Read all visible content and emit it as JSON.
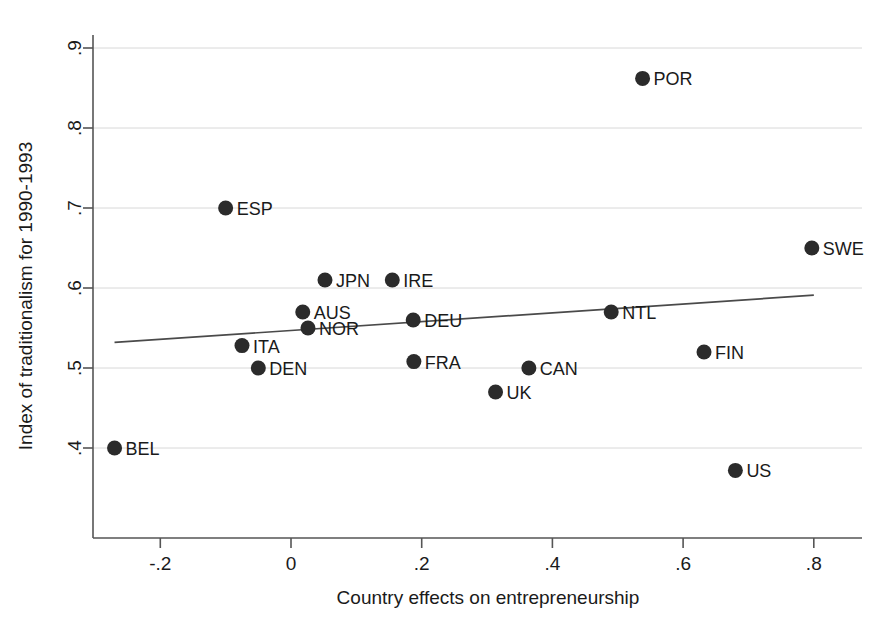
{
  "chart_data": {
    "type": "scatter",
    "title": "",
    "xlabel": "Country effects on entrepreneurship",
    "ylabel": "Index of traditionalism for 1990-1993",
    "xlim": [
      -0.3,
      0.86
    ],
    "ylim": [
      0.355,
      0.93
    ],
    "grid": true,
    "legend": "none",
    "xticks": [
      -0.2,
      0,
      0.2,
      0.4,
      0.6,
      0.8
    ],
    "xtick_labels": [
      "-.2",
      "0",
      ".2",
      ".4",
      ".6",
      ".8"
    ],
    "yticks": [
      0.4,
      0.5,
      0.6,
      0.7,
      0.8,
      0.9
    ],
    "ytick_labels": [
      ".4",
      ".5",
      ".6",
      ".7",
      ".8",
      ".9"
    ],
    "point_color": "#2b2b2b",
    "line_color": "#4a4a4a",
    "grid_color": "#d8d8d8",
    "points": [
      {
        "label": "BEL",
        "x": -0.27,
        "y": 0.4
      },
      {
        "label": "ESP",
        "x": -0.1,
        "y": 0.7
      },
      {
        "label": "ITA",
        "x": -0.075,
        "y": 0.528
      },
      {
        "label": "DEN",
        "x": -0.05,
        "y": 0.5
      },
      {
        "label": "AUS",
        "x": 0.018,
        "y": 0.57
      },
      {
        "label": "NOR",
        "x": 0.026,
        "y": 0.55
      },
      {
        "label": "JPN",
        "x": 0.052,
        "y": 0.61
      },
      {
        "label": "IRE",
        "x": 0.155,
        "y": 0.61
      },
      {
        "label": "DEU",
        "x": 0.187,
        "y": 0.56
      },
      {
        "label": "FRA",
        "x": 0.188,
        "y": 0.508
      },
      {
        "label": "UK",
        "x": 0.313,
        "y": 0.47
      },
      {
        "label": "CAN",
        "x": 0.364,
        "y": 0.5
      },
      {
        "label": "NTL",
        "x": 0.49,
        "y": 0.57
      },
      {
        "label": "POR",
        "x": 0.538,
        "y": 0.862
      },
      {
        "label": "FIN",
        "x": 0.632,
        "y": 0.52
      },
      {
        "label": "US",
        "x": 0.68,
        "y": 0.372
      },
      {
        "label": "SWE",
        "x": 0.797,
        "y": 0.65
      }
    ],
    "fit_line": {
      "x0": -0.27,
      "y0": 0.532,
      "x1": 0.8,
      "y1": 0.591
    }
  }
}
